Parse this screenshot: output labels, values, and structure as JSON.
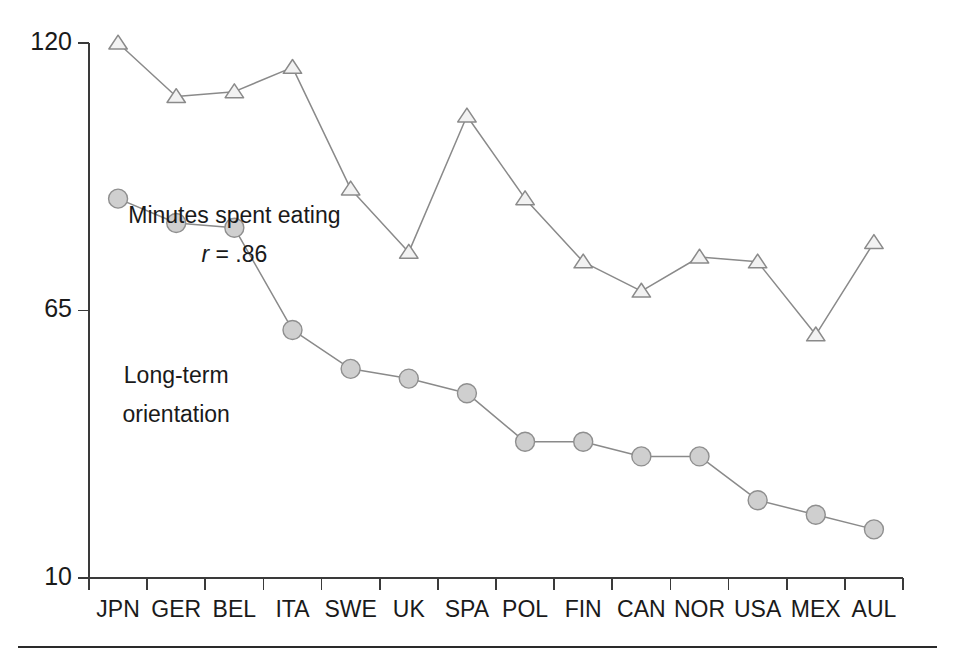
{
  "figure": {
    "background": "#ffffff",
    "footer_rule": true
  },
  "chart_data": {
    "type": "line",
    "title": "",
    "xlabel": "",
    "ylabel": "",
    "ylim": [
      10,
      120
    ],
    "yticks": [
      10,
      65,
      120
    ],
    "ytick_labels": [
      "10",
      "65",
      "120"
    ],
    "grid": false,
    "legend_position": "inline-annotation",
    "categories": [
      "JPN",
      "GER",
      "BEL",
      "ITA",
      "SWE",
      "UK",
      "SPA",
      "POL",
      "FIN",
      "CAN",
      "NOR",
      "USA",
      "MEX",
      "AUL"
    ],
    "series": [
      {
        "name": "Minutes spent eating",
        "marker": "triangle",
        "marker_fill": "#f2f2f2",
        "marker_stroke": "#8a8a8a",
        "line_color": "#8a8a8a",
        "values": [
          120,
          109,
          110,
          115,
          90,
          77,
          105,
          88,
          75,
          69,
          76,
          75,
          60,
          79
        ]
      },
      {
        "name": "Long-term orientation",
        "marker": "circle",
        "marker_fill": "#cfcfcf",
        "marker_stroke": "#8f8f8f",
        "line_color": "#8a8a8a",
        "values": [
          88,
          83,
          82,
          61,
          53,
          51,
          48,
          38,
          38,
          35,
          35,
          26,
          23,
          20
        ]
      }
    ],
    "annotations": [
      {
        "id": "eating-label",
        "text": "Minutes spent eating",
        "x_category": "BEL",
        "y_value": 83,
        "style": "normal"
      },
      {
        "id": "correlation-label",
        "text": "r = .86",
        "x_category": "BEL",
        "y_value": 75,
        "style": "italic-r"
      },
      {
        "id": "lto-label-line1",
        "text": "Long-term",
        "x_category": "GER",
        "y_value": 50,
        "style": "normal"
      },
      {
        "id": "lto-label-line2",
        "text": "orientation",
        "x_category": "GER",
        "y_value": 42,
        "style": "normal"
      }
    ],
    "correlation": {
      "symbol": "r",
      "operator": "=",
      "value": ".86"
    }
  }
}
